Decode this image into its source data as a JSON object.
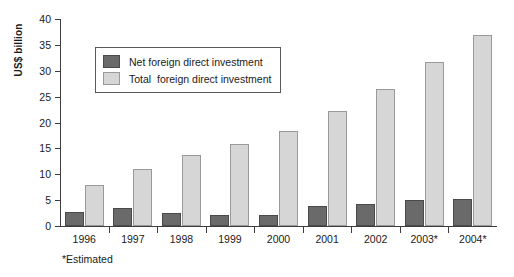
{
  "chart_data": {
    "type": "bar",
    "title": "",
    "xlabel": "",
    "ylabel": "US$ billion",
    "ylim": [
      0,
      40
    ],
    "yticks": [
      0,
      5,
      10,
      15,
      20,
      25,
      30,
      35,
      40
    ],
    "grid": false,
    "legend_position": "top-left-inside",
    "categories": [
      "1996",
      "1997",
      "1998",
      "1999",
      "2000",
      "2001",
      "2002",
      "2003*",
      "2004*"
    ],
    "series": [
      {
        "name": "Net foreign direct investment",
        "color": "#6a6a6a",
        "values": [
          2.8,
          3.5,
          2.5,
          2.1,
          2.2,
          3.8,
          4.2,
          5.0,
          5.2
        ]
      },
      {
        "name": "Total  foreign direct investment",
        "color": "#d6d6d6",
        "values": [
          7.9,
          11.1,
          13.7,
          15.9,
          18.4,
          22.2,
          26.4,
          31.6,
          37.0
        ]
      }
    ],
    "annotations": [
      "*Estimated"
    ]
  },
  "footnote": "*Estimated",
  "colors": {
    "net": "#6a6a6a",
    "total": "#d6d6d6",
    "axis": "#3d3d3d",
    "background": "#ffffff"
  }
}
